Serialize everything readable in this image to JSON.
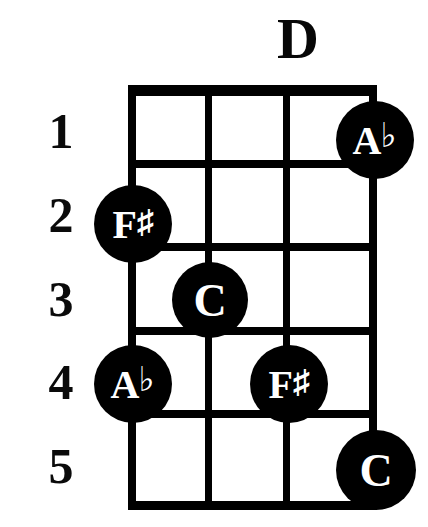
{
  "title": "D",
  "instrument_diagram": {
    "type": "chord-diagram",
    "string_count": 4,
    "fret_count": 5,
    "orientation": "vertical",
    "nut_shown": true
  },
  "fret_numbers": [
    {
      "label": "1"
    },
    {
      "label": "2"
    },
    {
      "label": "3"
    },
    {
      "label": "4"
    },
    {
      "label": "5"
    }
  ],
  "notes": [
    {
      "letter": "A",
      "accidental": "♭",
      "full": "A♭",
      "string": 4,
      "fret": 1
    },
    {
      "letter": "F",
      "accidental": "♯",
      "full": "F♯",
      "string": 1,
      "fret": 2
    },
    {
      "letter": "C",
      "accidental": "",
      "full": "C",
      "string": 2,
      "fret": 3
    },
    {
      "letter": "A",
      "accidental": "♭",
      "full": "A♭",
      "string": 1,
      "fret": 4
    },
    {
      "letter": "F",
      "accidental": "♯",
      "full": "F♯",
      "string": 3,
      "fret": 4
    },
    {
      "letter": "C",
      "accidental": "",
      "full": "C",
      "string": 4,
      "fret": 5
    }
  ],
  "colors": {
    "ink": "#000000",
    "paper": "#ffffff",
    "dot_fill": "#000000",
    "dot_text": "#ffffff"
  }
}
